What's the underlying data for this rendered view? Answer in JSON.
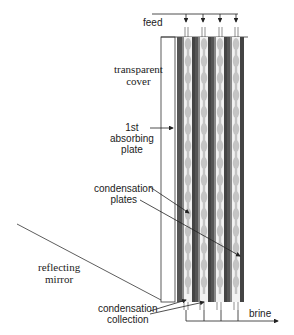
{
  "diagram": {
    "labels": {
      "feed": "feed",
      "transparent_cover_line1": "transparent",
      "transparent_cover_line2": "cover",
      "absorbing_plate_line1": "1st",
      "absorbing_plate_line2": "absorbing",
      "absorbing_plate_line3": "plate",
      "condensation_plates_line1": "condensation",
      "condensation_plates_line2": "plates",
      "reflecting_mirror_line1": "reflecting",
      "reflecting_mirror_line2": "mirror",
      "condensation_collection_line1": "condensation",
      "condensation_collection_line2": "collection",
      "brine": "brine"
    },
    "components": [
      {
        "name": "transparent cover",
        "type": "glass panel"
      },
      {
        "name": "1st absorbing plate",
        "type": "plate"
      },
      {
        "name": "condensation plates",
        "type": "plate",
        "count": 3
      },
      {
        "name": "reflecting mirror",
        "type": "inclined mirror"
      },
      {
        "name": "feed manifold",
        "type": "inlet",
        "branches": 4
      },
      {
        "name": "brine outlet",
        "type": "outlet"
      },
      {
        "name": "condensation collection",
        "type": "outlet"
      }
    ],
    "colors": {
      "line": "#222222",
      "plate_dark": "#4a4a4a",
      "plate_mid": "#7a7a7a",
      "wick": "#c8c8c8",
      "droplet": "#bdbdbd",
      "background": "#ffffff"
    }
  }
}
